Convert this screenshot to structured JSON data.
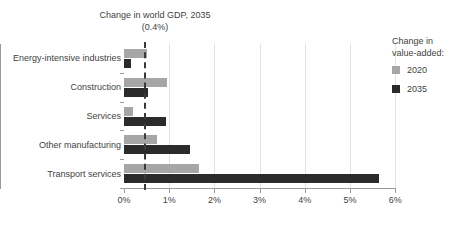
{
  "chart_data": {
    "type": "bar",
    "orientation": "horizontal",
    "title_line1": "Change in world GDP, 2035",
    "title_line2": "(0.4%)",
    "xlabel": "",
    "ylabel": "",
    "xlim": [
      0,
      6
    ],
    "xunit": "%",
    "grid": true,
    "legend_position": "right",
    "categories": [
      "Energy-intensive industries",
      "Construction",
      "Services",
      "Other manufacturing",
      "Transport services"
    ],
    "tick_labels": [
      "0%",
      "1%",
      "2%",
      "3%",
      "4%",
      "5%",
      "6%"
    ],
    "tick_values": [
      0,
      1,
      2,
      3,
      4,
      5,
      6
    ],
    "series": [
      {
        "name": "2020",
        "color": "#a6a6a6",
        "values": [
          0.5,
          0.95,
          0.2,
          0.73,
          1.65
        ]
      },
      {
        "name": "2035",
        "color": "#2b2b2b",
        "values": [
          0.15,
          0.52,
          0.93,
          1.47,
          5.65
        ]
      }
    ],
    "reference_line": {
      "label": "Change in world GDP, 2035",
      "value": 0.45,
      "display_value": "0.4%",
      "color": "#3a3a3a",
      "style": "dashed"
    }
  },
  "legend": {
    "title": "Change in\nvalue-added:",
    "title_line1": "Change in",
    "title_line2": "value-added:",
    "items": [
      {
        "label": "2020",
        "color": "#a6a6a6"
      },
      {
        "label": "2035",
        "color": "#2b2b2b"
      }
    ]
  }
}
